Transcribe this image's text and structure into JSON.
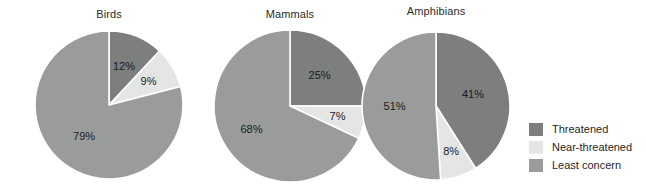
{
  "chart_data": {
    "type": "pie",
    "title": "",
    "legend_position": "right",
    "categories": [
      "Threatened",
      "Near-threatened",
      "Least concern"
    ],
    "colors": {
      "Threatened": "#7d7e7e",
      "Near-threatened": "#e4e5e5",
      "Least concern": "#9a9b9b",
      "separator": "#ffffff",
      "background": "#ffffff"
    },
    "charts": [
      {
        "title": "Birds",
        "center_x": 109,
        "center_y": 105,
        "radius": 74,
        "slices": [
          {
            "label": "Threatened",
            "value": 12,
            "display": "12%",
            "color": "#7d7e7e",
            "label_r": 0.55
          },
          {
            "label": "Near-threatened",
            "value": 9,
            "display": "9%",
            "color": "#e4e5e5",
            "label_r": 0.62
          },
          {
            "label": "Least concern",
            "value": 79,
            "display": "79%",
            "color": "#9a9b9b",
            "label_r": 0.55
          }
        ]
      },
      {
        "title": "Mammals",
        "center_x": 290,
        "center_y": 106,
        "radius": 76,
        "slices": [
          {
            "label": "Threatened",
            "value": 25,
            "display": "25%",
            "color": "#7d7e7e",
            "label_r": 0.55
          },
          {
            "label": "Near-threatened",
            "value": 7,
            "display": "7%",
            "color": "#e4e5e5",
            "label_r": 0.64
          },
          {
            "label": "Least concern",
            "value": 68,
            "display": "68%",
            "color": "#9a9b9b",
            "label_r": 0.6
          }
        ]
      },
      {
        "title": "Amphibians",
        "center_x": 436,
        "center_y": 106,
        "radius": 74,
        "slices": [
          {
            "label": "Threatened",
            "value": 41,
            "display": "41%",
            "color": "#7d7e7e",
            "label_r": 0.52
          },
          {
            "label": "Near-threatened",
            "value": 8,
            "display": "8%",
            "color": "#e4e5e5",
            "label_r": 0.66
          },
          {
            "label": "Least concern",
            "value": 51,
            "display": "51%",
            "color": "#9a9b9b",
            "label_r": 0.56
          }
        ]
      }
    ],
    "legend": [
      {
        "label": "Threatened",
        "color": "#7d7e7e"
      },
      {
        "label": "Near-threatened",
        "color": "#e4e5e5"
      },
      {
        "label": "Least concern",
        "color": "#9a9b9b"
      }
    ]
  }
}
